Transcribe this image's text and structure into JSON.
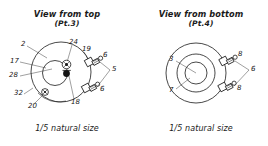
{
  "figure": {
    "kind": "technical-assembly-drawing",
    "ink_color": "#1b1b1b",
    "paper_color": "#ffffff"
  },
  "panels": [
    {
      "id": "view-top",
      "title_line1": "View from top",
      "title_line2": "(Pt.3)",
      "caption": "1/5 natural size",
      "callouts": [
        {
          "id": "c2",
          "label": "2"
        },
        {
          "id": "c24",
          "label": "24"
        },
        {
          "id": "c19",
          "label": "19"
        },
        {
          "id": "c17",
          "label": "17"
        },
        {
          "id": "c28",
          "label": "28"
        },
        {
          "id": "c32",
          "label": "32"
        },
        {
          "id": "c20",
          "label": "20"
        },
        {
          "id": "c18",
          "label": "18"
        },
        {
          "id": "c5",
          "label": "5"
        },
        {
          "id": "c6a",
          "label": "6"
        },
        {
          "id": "c6b",
          "label": "6"
        }
      ]
    },
    {
      "id": "view-bottom",
      "title_line1": "View from bottom",
      "title_line2": "(Pt.4)",
      "caption": "1/5 natural size",
      "callouts": [
        {
          "id": "r3",
          "label": "3"
        },
        {
          "id": "r7",
          "label": "7"
        },
        {
          "id": "r6",
          "label": "6"
        },
        {
          "id": "r8a",
          "label": "8"
        },
        {
          "id": "r8b",
          "label": "8"
        }
      ]
    }
  ]
}
